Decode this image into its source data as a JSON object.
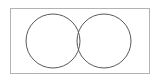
{
  "figure": {
    "name": "two-circle-venn-diagram",
    "kind": "diagram",
    "background_color": "#ffffff",
    "canvas": {
      "width": 162,
      "height": 83
    },
    "labels": {
      "left_circle": "",
      "right_circle": "",
      "intersection": "",
      "universe": "",
      "title": "",
      "caption": ""
    },
    "frame": {
      "name": "outer-rectangle",
      "x": 10,
      "y": 8,
      "width": 140,
      "height": 66,
      "stroke_color": "#b2b2b2",
      "stroke_width": 1,
      "fill": "none"
    },
    "circles": [
      {
        "name": "left-circle",
        "cx": 53,
        "cy": 41,
        "r": 27,
        "stroke_color": "#595959",
        "stroke_width": 1,
        "fill": "none"
      },
      {
        "name": "right-circle",
        "cx": 104,
        "cy": 41,
        "r": 27,
        "stroke_color": "#595959",
        "stroke_width": 1,
        "fill": "none"
      }
    ],
    "intersection_points": [
      {
        "name": "upper-intersection",
        "x": 78.5,
        "y": 15.1
      },
      {
        "name": "lower-intersection",
        "x": 78.5,
        "y": 66.9
      }
    ]
  }
}
